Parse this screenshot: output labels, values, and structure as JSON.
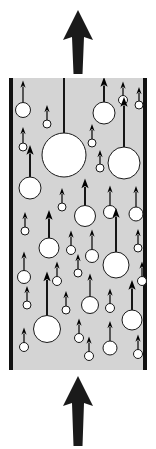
{
  "figure": {
    "canvas": {
      "width": 156,
      "height": 449
    },
    "colors": {
      "channel_fill": "#d4d4d4",
      "channel_wall": "#111111",
      "bubble_fill": "#ffffff",
      "bubble_stroke": "#1a1a1a",
      "vector": "#000000",
      "background": "#ffffff"
    },
    "channel": {
      "left": 9,
      "right": 147,
      "top": 78,
      "bottom": 370,
      "wall_thickness": 4,
      "label": "vertical-channel"
    },
    "inlet_arrow": {
      "label": "inlet-flow-arrow",
      "direction": "up",
      "x": 78,
      "tail_y": 446,
      "tip_y": 376,
      "shaft_width": 9,
      "head_width": 30,
      "head_height": 30
    },
    "outlet_arrow": {
      "label": "outlet-flow-arrow",
      "direction": "up",
      "x": 78,
      "tail_y": 74,
      "tip_y": 10,
      "shaft_width": 9,
      "head_width": 30,
      "head_height": 30
    },
    "bubbles": [
      {
        "id": 1,
        "cx": 23,
        "cy": 110,
        "r": 7.5,
        "vec": 22
      },
      {
        "id": 2,
        "cx": 47,
        "cy": 124,
        "r": 4.0,
        "vec": 15
      },
      {
        "id": 3,
        "cx": 23,
        "cy": 147,
        "r": 4.0,
        "vec": 16
      },
      {
        "id": 4,
        "cx": 64,
        "cy": 155,
        "r": 22.0,
        "vec": 70
      },
      {
        "id": 5,
        "cx": 104,
        "cy": 113,
        "r": 11.0,
        "vec": 25
      },
      {
        "id": 6,
        "cx": 123,
        "cy": 100,
        "r": 4.5,
        "vec": 14
      },
      {
        "id": 7,
        "cx": 139,
        "cy": 105,
        "r": 4.0,
        "vec": 14
      },
      {
        "id": 8,
        "cx": 92,
        "cy": 143,
        "r": 4.0,
        "vec": 15
      },
      {
        "id": 9,
        "cx": 124,
        "cy": 163,
        "r": 16.0,
        "vec": 50
      },
      {
        "id": 10,
        "cx": 30,
        "cy": 188,
        "r": 11.0,
        "vec": 32
      },
      {
        "id": 11,
        "cx": 100,
        "cy": 168,
        "r": 4.0,
        "vec": 14
      },
      {
        "id": 12,
        "cx": 62,
        "cy": 207,
        "r": 4.0,
        "vec": 15
      },
      {
        "id": 13,
        "cx": 85,
        "cy": 216,
        "r": 10.5,
        "vec": 27
      },
      {
        "id": 14,
        "cx": 110,
        "cy": 212,
        "r": 6.5,
        "vec": 20
      },
      {
        "id": 15,
        "cx": 136,
        "cy": 214,
        "r": 7.0,
        "vec": 21
      },
      {
        "id": 16,
        "cx": 25,
        "cy": 231,
        "r": 4.0,
        "vec": 15
      },
      {
        "id": 17,
        "cx": 49,
        "cy": 248,
        "r": 10.0,
        "vec": 28
      },
      {
        "id": 18,
        "cx": 71,
        "cy": 250,
        "r": 4.5,
        "vec": 15
      },
      {
        "id": 19,
        "cx": 92,
        "cy": 256,
        "r": 6.5,
        "vec": 20
      },
      {
        "id": 20,
        "cx": 138,
        "cy": 248,
        "r": 4.0,
        "vec": 15
      },
      {
        "id": 21,
        "cx": 116,
        "cy": 265,
        "r": 13.0,
        "vec": 44
      },
      {
        "id": 22,
        "cx": 24,
        "cy": 277,
        "r": 6.5,
        "vec": 19
      },
      {
        "id": 23,
        "cx": 57,
        "cy": 281,
        "r": 4.5,
        "vec": 15
      },
      {
        "id": 24,
        "cx": 78,
        "cy": 273,
        "r": 4.0,
        "vec": 15
      },
      {
        "id": 25,
        "cx": 142,
        "cy": 281,
        "r": 4.5,
        "vec": 15
      },
      {
        "id": 26,
        "cx": 27,
        "cy": 305,
        "r": 4.0,
        "vec": 15
      },
      {
        "id": 27,
        "cx": 66,
        "cy": 310,
        "r": 4.0,
        "vec": 15
      },
      {
        "id": 28,
        "cx": 47,
        "cy": 329,
        "r": 13.5,
        "vec": 44
      },
      {
        "id": 29,
        "cx": 90,
        "cy": 305,
        "r": 8.5,
        "vec": 23
      },
      {
        "id": 30,
        "cx": 110,
        "cy": 308,
        "r": 4.5,
        "vec": 15
      },
      {
        "id": 31,
        "cx": 132,
        "cy": 320,
        "r": 10.0,
        "vec": 30
      },
      {
        "id": 32,
        "cx": 24,
        "cy": 347,
        "r": 4.5,
        "vec": 15
      },
      {
        "id": 33,
        "cx": 79,
        "cy": 338,
        "r": 4.5,
        "vec": 15
      },
      {
        "id": 34,
        "cx": 89,
        "cy": 356,
        "r": 4.5,
        "vec": 15
      },
      {
        "id": 35,
        "cx": 110,
        "cy": 348,
        "r": 7.0,
        "vec": 20
      },
      {
        "id": 36,
        "cx": 138,
        "cy": 354,
        "r": 4.5,
        "vec": 15
      }
    ]
  }
}
